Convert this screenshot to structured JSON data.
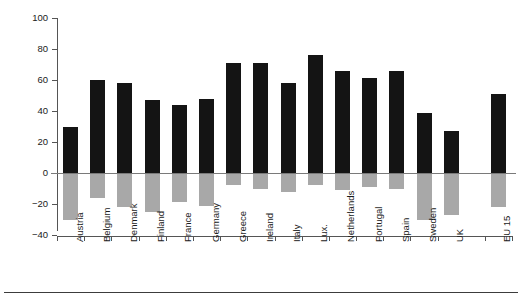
{
  "figure": {
    "background": "#ffffff",
    "bottom_rule_color": "#3c3c3c"
  },
  "axis": {
    "y_title": "Bad thing . . . . Good thing",
    "y_ticks": [
      100,
      80,
      60,
      40,
      20,
      0,
      -20,
      -40
    ],
    "y_tick_labels": [
      "100",
      "80",
      "60",
      "40",
      "20",
      "0",
      "−20",
      "−40"
    ],
    "y_min": -40,
    "y_max": 100,
    "x_title": ""
  },
  "colors": {
    "positive_bar": "#141414",
    "negative_bar": "#a8a8a8",
    "axis": "#555555",
    "zero_line": "#7a7a7a"
  },
  "chart_data": {
    "type": "bar",
    "title": "",
    "subtitle": "",
    "xlabel": "",
    "ylabel": "Bad thing . . . . Good thing",
    "ylim": [
      -40,
      100
    ],
    "grid": false,
    "legend": false,
    "categories": [
      "Austria",
      "Belgium",
      "Denmark",
      "Finland",
      "France",
      "Germany",
      "Greece",
      "Ireland",
      "Italy",
      "Lux.",
      "Netherlands",
      "Portugal",
      "Spain",
      "Sweden",
      "UK",
      "EU 15"
    ],
    "series": [
      {
        "name": "Good thing",
        "color": "#141414",
        "values": [
          30,
          60,
          58,
          47,
          44,
          48,
          71,
          71,
          58,
          76,
          66,
          61,
          66,
          39,
          27,
          51
        ]
      },
      {
        "name": "Bad thing",
        "color": "#a8a8a8",
        "values": [
          -30,
          -16,
          -22,
          -25,
          -19,
          -21,
          -8,
          -10,
          -12,
          -8,
          -11,
          -9,
          -10,
          -30,
          -27,
          -22
        ]
      }
    ]
  }
}
